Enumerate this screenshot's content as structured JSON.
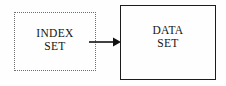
{
  "diagram": {
    "background_color": "#fefefe",
    "nodes": [
      {
        "id": "index-set",
        "line1": "INDEX",
        "line2": "SET",
        "border_style": "dotted",
        "border_color": "#6d6d6d",
        "text_color": "#141414"
      },
      {
        "id": "data-set",
        "line1": "DATA",
        "line2": "SET",
        "border_style": "solid",
        "border_color": "#1c1c1c",
        "text_color": "#141414"
      }
    ],
    "connector": {
      "id": "index-to-data-arrow",
      "direction": "right",
      "color": "#111111",
      "from": "index-set",
      "to": "data-set"
    }
  }
}
